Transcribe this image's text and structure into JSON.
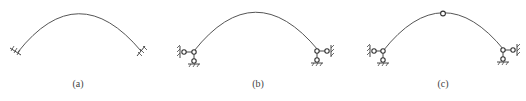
{
  "figures": [
    {
      "id": "a",
      "label": "(a)",
      "description": "Hingeless arch with fixed supports at both ends",
      "label_x": 78
    },
    {
      "id": "b",
      "label": "(b)",
      "description": "Arch with supports represented by link members (equivalent fixed supports)",
      "label_x": 258
    },
    {
      "id": "c",
      "label": "(c)",
      "description": "Arch with crown hinge and link-member supports",
      "label_x": 443
    }
  ],
  "colors": {
    "line": "#555555",
    "background": "#ffffff"
  }
}
